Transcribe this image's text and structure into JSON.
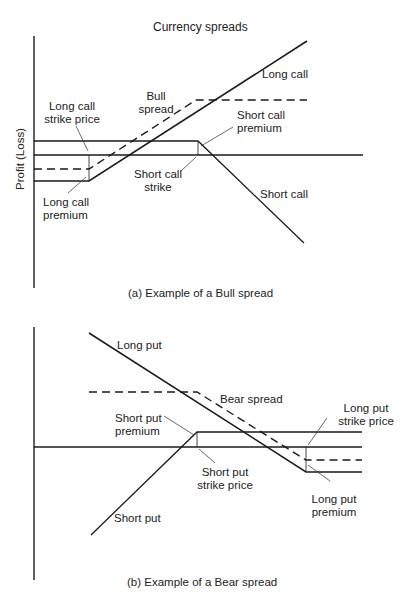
{
  "figure": {
    "title": "Currency spreads",
    "y_axis_label": "Profit (Loss)"
  },
  "panel_a": {
    "caption": "(a) Example of a Bull spread",
    "labels": {
      "long_call": "Long call",
      "bull_spread": [
        "Bull",
        "spread"
      ],
      "long_call_strike": [
        "Long call",
        "strike price"
      ],
      "short_call_premium": [
        "Short call",
        "premium"
      ],
      "short_call_strike": [
        "Short call",
        "strike"
      ],
      "long_call_premium": [
        "Long call",
        "premium"
      ],
      "short_call": "Short call"
    },
    "line_styles": {
      "payoff": "solid",
      "spread": "dashed"
    }
  },
  "panel_b": {
    "caption": "(b) Example of a Bear spread",
    "labels": {
      "long_put": "Long put",
      "bear_spread": "Bear spread",
      "long_put_strike": [
        "Long put",
        "strike price"
      ],
      "short_put_premium": [
        "Short put",
        "premium"
      ],
      "short_put_strike": [
        "Short put",
        "strike price"
      ],
      "long_put_premium": [
        "Long put",
        "premium"
      ],
      "short_put": "Short put"
    },
    "line_styles": {
      "payoff": "solid",
      "spread": "dashed"
    }
  },
  "colors": {
    "line": "#1a1a1a",
    "leader": "#444444",
    "background": "#ffffff"
  }
}
